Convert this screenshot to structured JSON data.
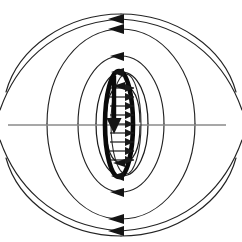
{
  "figure": {
    "title": "Magnetic dipole field of a current loop",
    "caption": "",
    "background_color": "#ffffff",
    "width": 242,
    "height": 242
  },
  "colors": {
    "field_line": "#232323",
    "axis_line": "#8a8a8a",
    "coil": "#0a0a0a",
    "arrow": "#141414",
    "background": "#ffffff"
  },
  "chart_data": {
    "type": "diagram",
    "subtype": "vector-field-lines",
    "title": "Magnetic dipole field of a current loop",
    "xlabel": "",
    "ylabel": "",
    "grid": false,
    "legend": false,
    "center": {
      "x": 121,
      "y": 124
    },
    "axis_line": {
      "name": "horizontal-equatorial-axis",
      "x1": 8,
      "y1": 125,
      "x2": 226,
      "y2": 125,
      "color": "#8a8a8a",
      "width": 1.7
    },
    "coil": {
      "name": "current-loop",
      "shape": "ellipse",
      "cx": 121,
      "cy": 124,
      "rx": 14,
      "ry": 53,
      "stroke_width": 4.6,
      "color": "#0a0a0a"
    },
    "coil_inner_outline": {
      "name": "coil-inner-thin-ellipse",
      "cx": 124,
      "cy": 124,
      "rx": 17,
      "ry": 51,
      "stroke_width": 1.1
    },
    "dipole_moment_arrow": {
      "name": "dipole-moment-arrow",
      "direction": "down",
      "x": 114,
      "y_start": 74,
      "y_end": 134,
      "head_width": 15,
      "head_length": 16
    },
    "interior_arrows": {
      "name": "interior-field-arrows",
      "direction": "right",
      "count": 9,
      "x_tail": 110,
      "x_head": 134,
      "y_values": [
        88,
        97,
        106,
        115,
        124,
        133,
        142,
        151,
        160
      ]
    },
    "field_lines": [
      {
        "name": "field-line-outer-1",
        "loop_index": 1,
        "size": "outermost",
        "half_width": 118,
        "half_height": 118,
        "arrow_side": "top",
        "arrow_direction": "left",
        "clipped": true
      },
      {
        "name": "field-line-outer-2",
        "loop_index": 2,
        "size": "large",
        "half_width": 82,
        "half_height": 95,
        "arrow_side": "top",
        "arrow_direction": "left",
        "clipped": false
      },
      {
        "name": "field-line-mid-3",
        "loop_index": 3,
        "size": "medium",
        "half_width": 48,
        "half_height": 68,
        "arrow_side": "top",
        "arrow_direction": "left",
        "clipped": false
      },
      {
        "name": "field-line-inner-4",
        "loop_index": 4,
        "size": "small",
        "half_width": 29,
        "half_height": 52,
        "arrow_side": "top",
        "arrow_direction": "left",
        "clipped": false
      },
      {
        "name": "field-line-inner-5",
        "loop_index": 5,
        "size": "smallest",
        "half_width": 18,
        "half_height": 44,
        "arrow_side": "top",
        "arrow_direction": "left",
        "clipped": false
      }
    ],
    "arrow_heads": [
      {
        "name": "arrowhead-top-outer",
        "x": 118,
        "y": 20,
        "direction": "left"
      },
      {
        "name": "arrowhead-top-mid",
        "x": 118,
        "y": 57,
        "direction": "left"
      },
      {
        "name": "arrowhead-top-inner",
        "x": 118,
        "y": 73,
        "direction": "left"
      },
      {
        "name": "arrowhead-top-innermost",
        "x": 118,
        "y": 87,
        "direction": "left"
      },
      {
        "name": "arrowhead-bottom-inner",
        "x": 118,
        "y": 163,
        "direction": "left"
      },
      {
        "name": "arrowhead-bottom-mid",
        "x": 118,
        "y": 192,
        "direction": "left"
      },
      {
        "name": "arrowhead-bottom-outer",
        "x": 118,
        "y": 230,
        "direction": "left"
      }
    ]
  }
}
